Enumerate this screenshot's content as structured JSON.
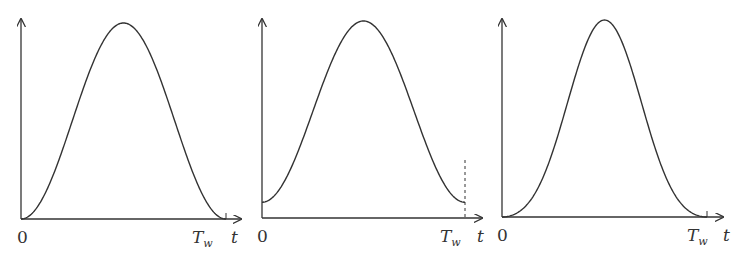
{
  "figure": {
    "stroke_color": "#333333",
    "background": "#ffffff"
  },
  "chart_data": [
    {
      "type": "line",
      "name": "window-1",
      "title": "",
      "xlabel": "t",
      "ylabel": "",
      "x_tick_labels": [
        "0",
        "Tw"
      ],
      "shape": "raised-cosine (Hann-like), starts and ends at 0",
      "x": [
        0,
        0.1,
        0.2,
        0.3,
        0.4,
        0.5,
        0.6,
        0.7,
        0.8,
        0.9,
        1.0
      ],
      "y": [
        0,
        0.095,
        0.345,
        0.655,
        0.905,
        1.0,
        0.905,
        0.655,
        0.345,
        0.095,
        0
      ],
      "xlim": [
        0,
        1
      ],
      "ylim": [
        0,
        1
      ],
      "grid": false
    },
    {
      "type": "line",
      "name": "window-2",
      "title": "",
      "xlabel": "t",
      "ylabel": "",
      "x_tick_labels": [
        "0",
        "Tw"
      ],
      "shape": "Hamming-like, nonzero at endpoints, dashed marker at Tw",
      "x": [
        0,
        0.1,
        0.2,
        0.3,
        0.4,
        0.5,
        0.6,
        0.7,
        0.8,
        0.9,
        1.0
      ],
      "y": [
        0.09,
        0.18,
        0.4,
        0.69,
        0.91,
        1.0,
        0.91,
        0.69,
        0.4,
        0.18,
        0.09
      ],
      "xlim": [
        0,
        1
      ],
      "ylim": [
        0,
        1
      ],
      "grid": false
    },
    {
      "type": "line",
      "name": "window-3",
      "title": "",
      "xlabel": "t",
      "ylabel": "",
      "x_tick_labels": [
        "0",
        "Tw"
      ],
      "shape": "Blackman-like, narrower peak, starts and ends at 0",
      "x": [
        0,
        0.1,
        0.2,
        0.3,
        0.4,
        0.5,
        0.6,
        0.7,
        0.8,
        0.9,
        1.0
      ],
      "y": [
        0,
        0.04,
        0.16,
        0.45,
        0.85,
        1.0,
        0.85,
        0.45,
        0.16,
        0.04,
        0
      ],
      "xlim": [
        0,
        1
      ],
      "ylim": [
        0,
        1
      ],
      "grid": false
    }
  ],
  "labels": {
    "origin": "0",
    "tw_main": "T",
    "tw_sub": "w",
    "t": "t"
  }
}
